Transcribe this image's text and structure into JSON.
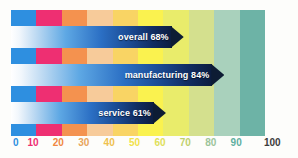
{
  "chart_data": {
    "type": "bar",
    "orientation": "horizontal",
    "title": "",
    "subtitle": "",
    "xlabel": "",
    "ylabel": "",
    "xlim": [
      0,
      100
    ],
    "grid": false,
    "legend": "none",
    "categories": [
      "overall",
      "manufacturing",
      "service"
    ],
    "values": [
      68,
      84,
      61
    ],
    "unit": "%",
    "bars": [
      {
        "category": "overall",
        "value": 68,
        "label": "overall 68%"
      },
      {
        "category": "manufacturing",
        "value": 84,
        "label": "manufacturing 84%"
      },
      {
        "category": "service",
        "value": 61,
        "label": "service 61%"
      }
    ],
    "xticks": [
      0,
      10,
      20,
      30,
      40,
      50,
      60,
      70,
      80,
      90,
      100
    ],
    "xticklabels": [
      "0",
      "10",
      "20",
      "30",
      "40",
      "50",
      "60",
      "70",
      "80",
      "90",
      "100"
    ],
    "xtick_colors": [
      "#2E8FE0",
      "#EE2F72",
      "#F0873F",
      "#E8A55C",
      "#EFC14E",
      "#F2E24A",
      "#DFE05A",
      "#BFD06A",
      "#9CC49A",
      "#5FAFA0",
      "#3C3C3C"
    ],
    "background_bands": [
      {
        "range": [
          0,
          10
        ],
        "color": "#2E8FE0"
      },
      {
        "range": [
          10,
          20
        ],
        "color": "#EE2F72"
      },
      {
        "range": [
          20,
          30
        ],
        "color": "#F4924F"
      },
      {
        "range": [
          30,
          40
        ],
        "color": "#F7CB9A"
      },
      {
        "range": [
          40,
          50
        ],
        "color": "#F9D464"
      },
      {
        "range": [
          50,
          60
        ],
        "color": "#FAF24F"
      },
      {
        "range": [
          60,
          70
        ],
        "color": "#E9EC6B"
      },
      {
        "range": [
          70,
          80
        ],
        "color": "#D4E08E"
      },
      {
        "range": [
          80,
          90
        ],
        "color": "#A9D1BC"
      },
      {
        "range": [
          90,
          100
        ],
        "color": "#6DB3A6"
      }
    ],
    "bar_colors": {
      "shaft_start": "#FFFFFF",
      "shaft_mid": "#2B6FC4",
      "shaft_end": "#0C1D3F",
      "arrowhead": "#0D1C34",
      "label_text": "#FFFFFF"
    }
  }
}
